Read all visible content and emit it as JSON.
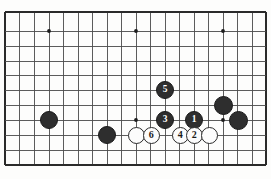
{
  "figure": {
    "kind": "go-board-diagram",
    "background_color": "#fdfdfc",
    "line_color": "#4a4a4a",
    "black_color": "#2e2e2e",
    "white_color": "#fcfcfc"
  },
  "board": {
    "origin_x": 5,
    "origin_y": 12,
    "cell": 14.5,
    "cols": 18,
    "rows": 10.55,
    "star_points": [
      {
        "cx": 49,
        "cy": 31
      },
      {
        "cx": 136,
        "cy": 31
      },
      {
        "cx": 223,
        "cy": 31
      },
      {
        "cx": 136,
        "cy": 120
      },
      {
        "cx": 223,
        "cy": 120
      }
    ]
  },
  "stones": [
    {
      "id": "black-left-upper",
      "color": "black",
      "label": "",
      "cx": 49,
      "cy": 120,
      "r": 9
    },
    {
      "id": "black-left-lower",
      "color": "black",
      "label": "",
      "cx": 107,
      "cy": 135,
      "r": 9
    },
    {
      "id": "white-plain-left",
      "color": "white",
      "label": "",
      "cx": 136,
      "cy": 135,
      "r": 8.5
    },
    {
      "id": "white-move-6",
      "color": "white",
      "label": "6",
      "cx": 151,
      "cy": 135,
      "r": 8.5
    },
    {
      "id": "black-move-5",
      "color": "black",
      "label": "5",
      "cx": 165,
      "cy": 90,
      "r": 9
    },
    {
      "id": "black-move-3",
      "color": "black",
      "label": "3",
      "cx": 165,
      "cy": 120,
      "r": 9
    },
    {
      "id": "white-move-4",
      "color": "white",
      "label": "4",
      "cx": 180,
      "cy": 135,
      "r": 8.5
    },
    {
      "id": "black-move-1",
      "color": "black",
      "label": "1",
      "cx": 194,
      "cy": 120,
      "r": 9
    },
    {
      "id": "white-move-2",
      "color": "white",
      "label": "2",
      "cx": 194,
      "cy": 135,
      "r": 8.5
    },
    {
      "id": "white-plain-right",
      "color": "white",
      "label": "",
      "cx": 209,
      "cy": 135,
      "r": 8.5
    },
    {
      "id": "black-right-upper",
      "color": "black",
      "label": "",
      "cx": 223,
      "cy": 105,
      "r": 9.5
    },
    {
      "id": "black-right-lower",
      "color": "black",
      "label": "",
      "cx": 238,
      "cy": 120,
      "r": 9.5
    }
  ],
  "grid": {
    "vertical_x": [
      5,
      19.5,
      34,
      49,
      63.5,
      78,
      92.5,
      107,
      121.5,
      136,
      150.5,
      165,
      179.5,
      194,
      208.5,
      223,
      237.5,
      252,
      266
    ],
    "horizontal_y": [
      12,
      31,
      46,
      61,
      75,
      90,
      105,
      120,
      135,
      150,
      165
    ]
  }
}
